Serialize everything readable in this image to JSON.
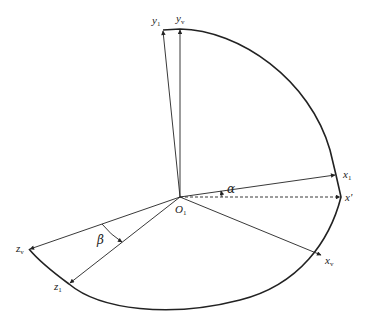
{
  "diagram": {
    "type": "coordinate-frame-rotation",
    "origin": {
      "label": "O",
      "subscript": "1"
    },
    "axes": [
      {
        "id": "y1",
        "label": "y",
        "subscript": "1",
        "style": "solid"
      },
      {
        "id": "yv",
        "label": "y",
        "subscript": "v",
        "style": "solid"
      },
      {
        "id": "x1",
        "label": "x",
        "subscript": "1",
        "style": "solid"
      },
      {
        "id": "xprime",
        "label": "x'",
        "subscript": "",
        "style": "dashed"
      },
      {
        "id": "xv",
        "label": "x",
        "subscript": "v",
        "style": "solid"
      },
      {
        "id": "zv",
        "label": "z",
        "subscript": "v",
        "style": "solid"
      },
      {
        "id": "z1",
        "label": "z",
        "subscript": "1",
        "style": "solid"
      }
    ],
    "angles": [
      {
        "id": "alpha",
        "symbol": "α",
        "between": [
          "x'",
          "x1"
        ]
      },
      {
        "id": "beta",
        "symbol": "β",
        "between": [
          "zv",
          "z1"
        ]
      }
    ],
    "colors": {
      "line": "#222222",
      "background": "#ffffff"
    }
  }
}
